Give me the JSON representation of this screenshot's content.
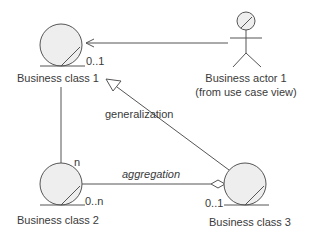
{
  "diagram": {
    "colors": {
      "stroke": "#555555",
      "fill": "#eeeeee",
      "text": "#3a3a3a"
    },
    "classes": [
      {
        "id": "class1",
        "label": "Business class 1"
      },
      {
        "id": "class2",
        "label": "Business class 2"
      },
      {
        "id": "class3",
        "label": "Business class 3"
      }
    ],
    "actor": {
      "label_line1": "Business actor 1",
      "label_line2": "(from use case view)"
    },
    "relationships": {
      "actor_to_class1": {
        "type": "association",
        "multiplicity_class1": "0..1"
      },
      "class1_to_class2": {
        "type": "association",
        "multiplicity_class2": "n"
      },
      "generalization": {
        "label": "generalization"
      },
      "aggregation": {
        "label": "aggregation",
        "multiplicity_class2": "0..n",
        "multiplicity_class3": "0..1"
      }
    }
  }
}
